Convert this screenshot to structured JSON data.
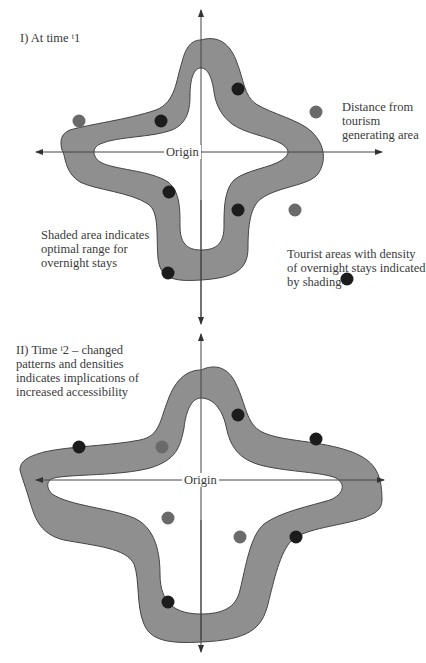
{
  "figure_1": {
    "title_prefix": "I) At time ",
    "title_sup": "t",
    "title_sub": "1",
    "origin_label": "Origin",
    "distance_label": [
      "Distance from",
      "tourism",
      "generating area"
    ],
    "shaded_label": [
      "Shaded area indicates",
      "optimal range for",
      "overnight stays"
    ],
    "tourist_label": [
      "Tourist areas with density",
      "of overnight stays indicated",
      "by shading"
    ]
  },
  "figure_2": {
    "title_lines": [
      "II) Time ",
      "patterns and densities",
      "indicates implications of",
      "increased accessibility"
    ],
    "title_sup": "t",
    "title_rest": "2 – changed",
    "origin_label": "Origin"
  },
  "colors": {
    "band_fill": "#8f8f8f",
    "band_stroke": "#444444",
    "dot_dark": "#1c1c1c",
    "dot_grey": "#6a6a6a",
    "axis": "#444444"
  }
}
